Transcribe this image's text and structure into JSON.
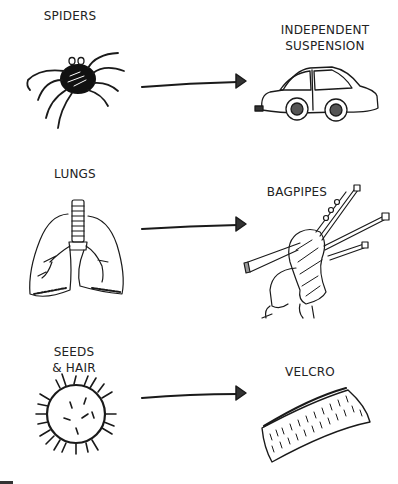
{
  "diagram": {
    "type": "biomimicry-mapping",
    "rows": [
      {
        "source": {
          "label": "SPIDERS",
          "icon": "spider-icon"
        },
        "target": {
          "label": "INDEPENDENT\nSUSPENSION",
          "icon": "car-icon"
        }
      },
      {
        "source": {
          "label": "LUNGS",
          "icon": "lungs-icon"
        },
        "target": {
          "label": "BAGPIPES",
          "icon": "bagpipes-icon"
        }
      },
      {
        "source": {
          "label": "SEEDS\n& HAIR",
          "icon": "burr-seed-icon"
        },
        "target": {
          "label": "VELCRO",
          "icon": "velcro-icon"
        }
      }
    ],
    "connector": "arrow-right",
    "colors": {
      "ink": "#1a1a1a",
      "background": "#ffffff"
    }
  }
}
